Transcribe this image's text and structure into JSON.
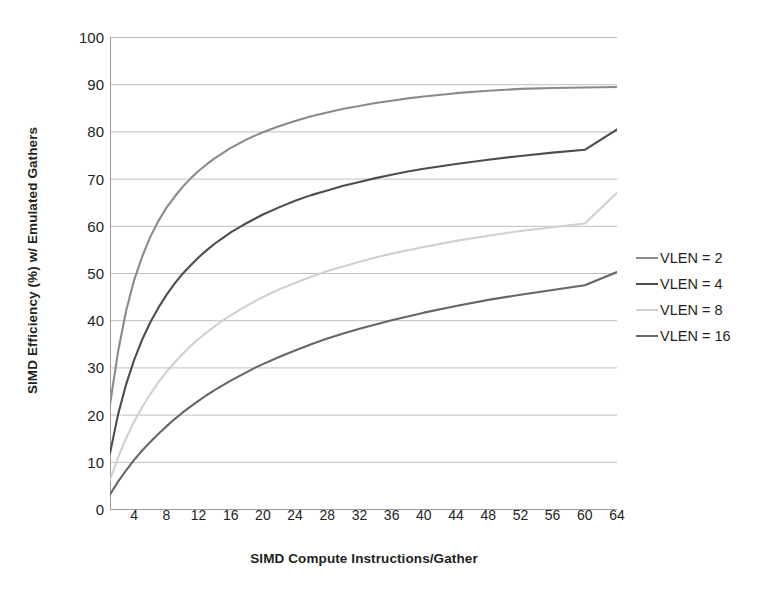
{
  "chart_data": {
    "type": "line",
    "title": "",
    "xlabel": "SIMD Compute Instructions/Gather",
    "ylabel": "SIMD Efficiency (%) w/ Emulated Gathers",
    "xlim": [
      1,
      64
    ],
    "ylim": [
      0,
      100
    ],
    "grid": true,
    "legend_position": "right",
    "x_ticks": [
      4,
      8,
      12,
      16,
      20,
      24,
      28,
      32,
      36,
      40,
      44,
      48,
      52,
      56,
      60,
      64
    ],
    "x_minor_tick_step": 1,
    "y_ticks": [
      0,
      10,
      20,
      30,
      40,
      50,
      60,
      70,
      80,
      90,
      100
    ],
    "x": [
      1,
      2,
      3,
      4,
      5,
      6,
      7,
      8,
      9,
      10,
      11,
      12,
      13,
      14,
      15,
      16,
      17,
      18,
      19,
      20,
      22,
      24,
      26,
      28,
      30,
      32,
      34,
      36,
      38,
      40,
      44,
      48,
      52,
      56,
      60,
      64
    ],
    "series": [
      {
        "name": "VLEN = 2",
        "color": "#8a8a8a",
        "values": [
          22.2,
          33.3,
          42.0,
          48.5,
          53.5,
          57.6,
          61.0,
          63.8,
          66.1,
          68.2,
          70.0,
          71.6,
          73.0,
          74.3,
          75.4,
          76.5,
          77.4,
          78.3,
          79.1,
          79.8,
          81.1,
          82.2,
          83.2,
          84.0,
          84.8,
          85.4,
          86.0,
          86.5,
          87.0,
          87.4,
          88.1,
          88.6,
          89.0,
          89.2,
          89.3,
          89.4
        ]
      },
      {
        "name": "VLEN = 4",
        "color": "#4d4d4d",
        "values": [
          11.8,
          20.0,
          26.4,
          31.6,
          35.9,
          39.5,
          42.6,
          45.3,
          47.7,
          49.8,
          51.6,
          53.3,
          54.8,
          56.2,
          57.4,
          58.6,
          59.6,
          60.6,
          61.5,
          62.4,
          63.9,
          65.3,
          66.5,
          67.5,
          68.5,
          69.3,
          70.1,
          70.8,
          71.5,
          72.1,
          73.1,
          74.0,
          74.8,
          75.5,
          76.1,
          80.4
        ]
      },
      {
        "name": "VLEN = 8",
        "color": "#d0d0d0",
        "values": [
          6.1,
          10.9,
          15.0,
          18.5,
          21.6,
          24.3,
          26.8,
          29.0,
          31.0,
          32.8,
          34.5,
          36.0,
          37.4,
          38.7,
          39.9,
          41.0,
          42.1,
          43.1,
          44.0,
          44.9,
          46.5,
          47.9,
          49.2,
          50.4,
          51.4,
          52.4,
          53.3,
          54.1,
          54.8,
          55.5,
          56.8,
          57.9,
          58.9,
          59.7,
          60.5,
          67.0
        ]
      },
      {
        "name": "VLEN = 16",
        "color": "#666666",
        "values": [
          3.1,
          5.8,
          8.2,
          10.4,
          12.4,
          14.2,
          15.9,
          17.5,
          19.0,
          20.4,
          21.7,
          22.9,
          24.1,
          25.2,
          26.2,
          27.2,
          28.1,
          29.0,
          29.9,
          30.7,
          32.2,
          33.6,
          34.9,
          36.1,
          37.2,
          38.2,
          39.1,
          40.0,
          40.8,
          41.6,
          43.0,
          44.3,
          45.4,
          46.4,
          47.4,
          50.2
        ]
      }
    ]
  },
  "legend": {
    "items": [
      {
        "label": "VLEN = 2",
        "color": "#8a8a8a"
      },
      {
        "label": "VLEN = 4",
        "color": "#4d4d4d"
      },
      {
        "label": "VLEN = 8",
        "color": "#d0d0d0"
      },
      {
        "label": "VLEN = 16",
        "color": "#666666"
      }
    ]
  },
  "style": {
    "grid_color": "#bfbfbf",
    "axis_color": "#9a9a9a",
    "text_color": "#231f20",
    "background": "#ffffff"
  }
}
